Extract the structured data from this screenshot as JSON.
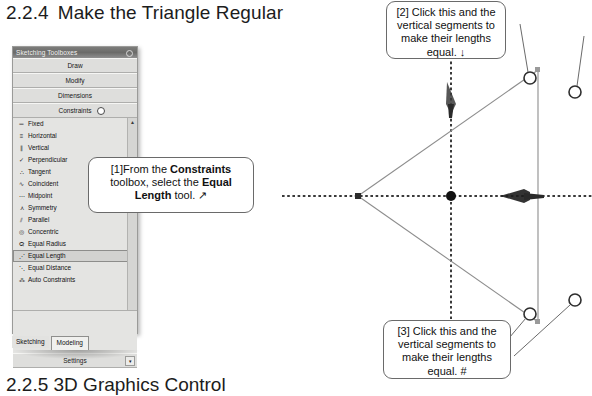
{
  "document": {
    "section_heading_number": "2.2.4",
    "section_heading_text": "Make the Triangle Regular",
    "next_heading": "2.2.5  3D Graphics Control"
  },
  "toolbox_panel": {
    "title": "Sketching Toolboxes",
    "pin_icon": "pin-icon",
    "sections": [
      {
        "label": "Draw",
        "has_indicator": false
      },
      {
        "label": "Modify",
        "has_indicator": false
      },
      {
        "label": "Dimensions",
        "has_indicator": false
      },
      {
        "label": "Constraints",
        "has_indicator": true
      }
    ],
    "constraints": [
      {
        "label": "Fixed",
        "glyph": "═",
        "icon": "fixed-icon",
        "selected": false
      },
      {
        "label": "Horizontal",
        "glyph": "≡",
        "icon": "horizontal-icon",
        "selected": false
      },
      {
        "label": "Vertical",
        "glyph": "∥",
        "icon": "vertical-icon",
        "selected": false
      },
      {
        "label": "Perpendicular",
        "glyph": "✓",
        "icon": "perpendicular-icon",
        "selected": false
      },
      {
        "label": "Tangent",
        "glyph": "∴",
        "icon": "tangent-icon",
        "selected": false
      },
      {
        "label": "Coincident",
        "glyph": "∿",
        "icon": "coincident-icon",
        "selected": false
      },
      {
        "label": "Midpoint",
        "glyph": "⋯",
        "icon": "midpoint-icon",
        "selected": false
      },
      {
        "label": "Symmetry",
        "glyph": "⋏",
        "icon": "symmetry-icon",
        "selected": false
      },
      {
        "label": "Parallel",
        "glyph": "⫽",
        "icon": "parallel-icon",
        "selected": false
      },
      {
        "label": "Concentric",
        "glyph": "◎",
        "icon": "concentric-icon",
        "selected": false
      },
      {
        "label": "Equal Radius",
        "glyph": "ⵕ",
        "icon": "equal-radius-icon",
        "selected": false
      },
      {
        "label": "Equal Length",
        "glyph": "⋰",
        "icon": "equal-length-icon",
        "selected": true
      },
      {
        "label": "Equal Distance",
        "glyph": "⋱",
        "icon": "equal-distance-icon",
        "selected": false
      },
      {
        "label": "Auto Constraints",
        "glyph": "⁂",
        "icon": "auto-constraints-icon",
        "selected": false
      }
    ],
    "settings_label": "Settings",
    "settings_overflow_glyph": "▾",
    "scroll_up_glyph": "▲",
    "scroll_down_glyph": "▼",
    "tabs": [
      {
        "label": "Sketching",
        "active": false
      },
      {
        "label": "Modeling",
        "active": true
      }
    ]
  },
  "callouts": {
    "one": {
      "marker": "[1]",
      "text_a": "From the ",
      "bold_a": "Constraints",
      "text_b": " toolbox, select the ",
      "bold_b": "Equal Length",
      "text_c": " tool. ",
      "pointer_glyph": "↗"
    },
    "two": {
      "marker": "[2]",
      "text": "Click this and the vertical segments to make their lengths equal. ",
      "pointer_glyph": "↓"
    },
    "three": {
      "marker": "[3]",
      "text": "Click this and the vertical segments to make their lengths equal. ",
      "pointer_glyph": "#"
    }
  },
  "sketch": {
    "name": "triangle-sketch",
    "axis_color": "#3a3a3a",
    "edge_color": "#8d8d8d",
    "point_color": "#111111",
    "vertices": {
      "left": {
        "x": 90,
        "y": 196
      },
      "top_right": {
        "x": 270,
        "y": 70
      },
      "bottom_right": {
        "x": 270,
        "y": 322
      }
    },
    "origin": {
      "x": 183,
      "y": 196
    },
    "handles": [
      {
        "name": "handle-top-vertex",
        "x": 262,
        "y": 78
      },
      {
        "name": "handle-right-upper",
        "x": 306,
        "y": 92
      },
      {
        "name": "handle-right-lower",
        "x": 306,
        "y": 300
      },
      {
        "name": "handle-bottom-vertex",
        "x": 262,
        "y": 314
      }
    ],
    "cursors": [
      {
        "name": "cursor-vertical-arrow",
        "x": 183,
        "y": 112
      },
      {
        "name": "cursor-horizontal-arrow",
        "x": 258,
        "y": 196
      }
    ]
  }
}
